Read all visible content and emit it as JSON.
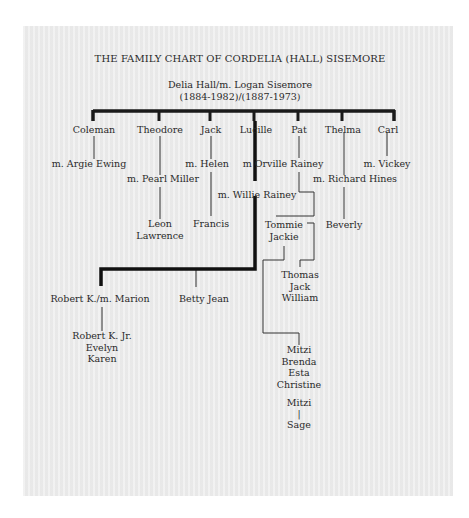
{
  "chart": {
    "title": "THE FAMILY CHART OF CORDELIA (HALL) SISEMORE",
    "root": {
      "couple": "Delia Hall/m. Logan Sisemore",
      "dates": "(1884-1982)/(1887-1973)"
    },
    "children": [
      {
        "name": "Coleman",
        "spouse": "m. Argie Ewing"
      },
      {
        "name": "Theodore",
        "spouse": "m. Pearl Miller",
        "children": [
          "Leon",
          "Lawrence"
        ]
      },
      {
        "name": "Jack",
        "spouse": "m. Helen",
        "children": [
          "Francis"
        ]
      },
      {
        "name": "Lucille",
        "spouse": "m. Willie Rainey",
        "children": [
          "Robert K./m. Marion",
          "Betty Jean"
        ]
      },
      {
        "name": "Pat",
        "spouse": "m Orville Rainey",
        "children": [
          "Tommie",
          "Jackie"
        ]
      },
      {
        "name": "Thelma",
        "spouse": "m. Richard Hines",
        "children": [
          "Beverly"
        ]
      },
      {
        "name": "Carl",
        "spouse": "m. Vickey"
      }
    ],
    "grandchildren": {
      "robert_children": [
        "Robert K. Jr.",
        "Evelyn",
        "Karen"
      ],
      "tommie_children": [
        "Thomas",
        "Jack",
        "William"
      ],
      "jackie_children": [
        "Mitzi",
        "Brenda",
        "Esta",
        "Christine"
      ],
      "mitzi_child_parent": "Mitzi",
      "mitzi_child_separator": "|",
      "mitzi_child": "Sage"
    }
  }
}
